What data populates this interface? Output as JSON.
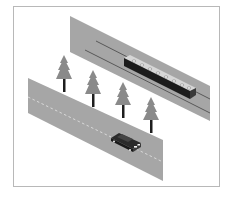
{
  "scene": {
    "title": "Isometric illustration: train on elevated track, row of pine trees, car on road",
    "colors": {
      "background": "#ffffff",
      "frame": "#b8b8b8",
      "band_fill": "#a6a6a6",
      "band_edge": "#8f8f8f",
      "rail_line": "#444444",
      "road_dash": "#e6e6e6",
      "train_top": "#d6d6d6",
      "train_side": "#1c1c1c",
      "train_window": "#f2f2f2",
      "tree_foliage": "#8a8a8a",
      "tree_trunk": "#1e1e1e",
      "car_body": "#2a2a2a",
      "car_light": "#eeeeee"
    },
    "elements": {
      "frame": "frame",
      "rail_band": "railway",
      "train": "train",
      "trees": [
        "tree",
        "tree",
        "tree",
        "tree"
      ],
      "road": "road",
      "car": "car"
    }
  }
}
